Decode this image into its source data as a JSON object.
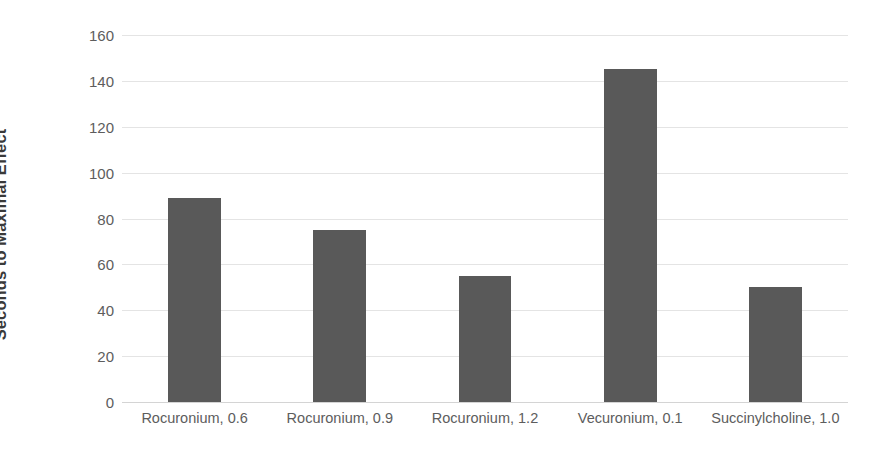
{
  "chart_data": {
    "type": "bar",
    "title": "",
    "subtitle": "",
    "xlabel": "",
    "ylabel": "Seconds to Maximal Effect",
    "categories": [
      "Rocuronium, 0.6",
      "Rocuronium, 0.9",
      "Rocuronium, 1.2",
      "Vecuronium, 0.1",
      "Succinylcholine, 1.0"
    ],
    "values": [
      89,
      75,
      55,
      145,
      50
    ],
    "series": [
      {
        "name": "Seconds to Maximal Effect",
        "values": [
          89,
          75,
          55,
          145,
          50
        ]
      }
    ],
    "ylim": [
      0,
      160
    ],
    "ytick_labels": [
      "160",
      "140",
      "120",
      "100",
      "80",
      "60",
      "40",
      "20",
      "0"
    ],
    "ytick_values": [
      160,
      140,
      120,
      100,
      80,
      60,
      40,
      20,
      0
    ],
    "ytick_step": 20,
    "grid": true,
    "grid_axis": "y",
    "legend": false,
    "legend_position": "none",
    "bar_color": "#595959",
    "grid_color": "#e4e4e4",
    "axis_text_color": "#5d5d5d",
    "title_text_color": "#3a3a3a",
    "background_color": "#ffffff",
    "annotations": []
  }
}
